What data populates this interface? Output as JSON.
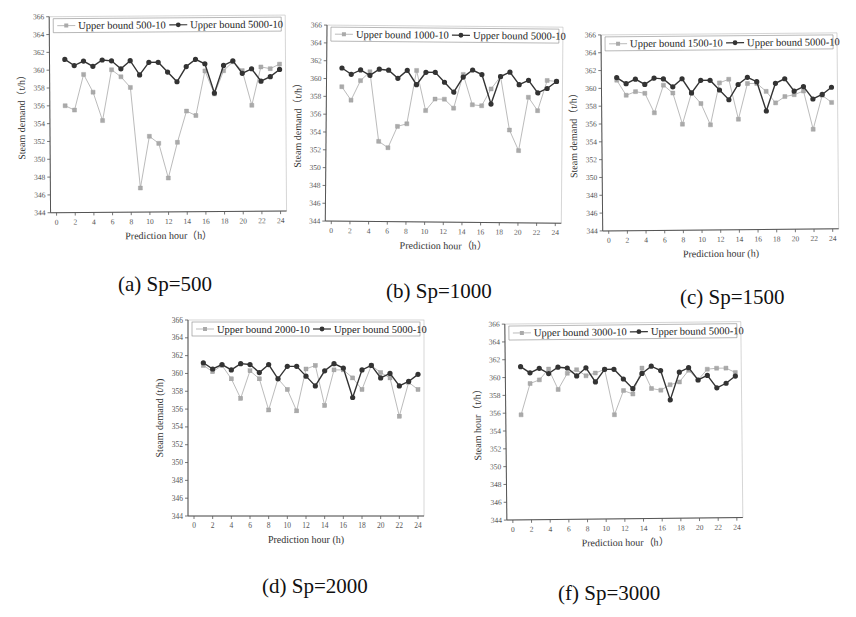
{
  "figure": {
    "captions": [
      "(a) Sp=500",
      "(b) Sp=1000",
      "(c) Sp=1500",
      "(d) Sp=2000",
      "(f) Sp=3000"
    ]
  },
  "colors": {
    "baseline_series": "#333333",
    "compare_series": "#aaaaaa",
    "axis": "#555555"
  },
  "chart_data": [
    {
      "id": "a",
      "type": "line",
      "caption": "(a) Sp=500",
      "xlabel": "Prediction hour（h）",
      "ylabel": "Steam demand（t/h）",
      "xlim": [
        0,
        24
      ],
      "ylim": [
        344,
        366
      ],
      "xticks": [
        0,
        2,
        4,
        6,
        8,
        10,
        12,
        14,
        16,
        18,
        20,
        22,
        24
      ],
      "yticks": [
        344,
        346,
        348,
        350,
        352,
        354,
        356,
        358,
        360,
        362,
        364,
        366
      ],
      "legend_position": "top",
      "x": [
        1,
        2,
        3,
        4,
        5,
        6,
        7,
        8,
        9,
        10,
        11,
        12,
        13,
        14,
        15,
        16,
        17,
        18,
        19,
        20,
        21,
        22,
        23,
        24
      ],
      "series": [
        {
          "name": "Upper bound 500-10",
          "marker": "square",
          "values": [
            356.0,
            355.5,
            359.5,
            357.5,
            354.3,
            360.0,
            359.2,
            358.0,
            346.7,
            352.5,
            351.7,
            347.8,
            351.8,
            355.3,
            354.8,
            359.8,
            357.2,
            359.8,
            360.8,
            359.8,
            355.9,
            360.2,
            360.0,
            360.5
          ]
        },
        {
          "name": "Upper bound 5000-10",
          "marker": "circle",
          "values": [
            361.2,
            360.5,
            361.0,
            360.4,
            361.1,
            361.0,
            360.1,
            361.0,
            359.4,
            360.8,
            360.8,
            359.7,
            358.6,
            360.3,
            361.1,
            360.6,
            357.3,
            360.4,
            360.9,
            359.5,
            360.0,
            358.6,
            359.1,
            359.9
          ]
        }
      ]
    },
    {
      "id": "b",
      "type": "line",
      "caption": "(b) Sp=1000",
      "xlabel": "Prediction hour（h）",
      "ylabel": "Steam demand（t/h）",
      "xlim": [
        0,
        24
      ],
      "ylim": [
        344,
        366
      ],
      "xticks": [
        0,
        2,
        4,
        6,
        8,
        10,
        12,
        14,
        16,
        18,
        20,
        22,
        24
      ],
      "yticks": [
        344,
        346,
        348,
        350,
        352,
        354,
        356,
        358,
        360,
        362,
        364,
        366
      ],
      "legend_position": "top",
      "x": [
        1,
        2,
        3,
        4,
        5,
        6,
        7,
        8,
        9,
        10,
        11,
        12,
        13,
        14,
        15,
        16,
        17,
        18,
        19,
        20,
        21,
        22,
        23,
        24
      ],
      "series": [
        {
          "name": "Upper bound 1000-10",
          "marker": "square",
          "values": [
            359.1,
            357.6,
            359.8,
            360.8,
            353.0,
            352.3,
            354.7,
            355.0,
            361.0,
            356.5,
            357.8,
            357.8,
            356.8,
            360.6,
            357.2,
            357.1,
            359.0,
            360.4,
            354.4,
            352.1,
            358.1,
            356.6,
            360.0,
            359.9
          ]
        },
        {
          "name": "Upper bound 5000-10",
          "marker": "circle",
          "values": [
            361.2,
            360.5,
            361.0,
            360.4,
            361.1,
            361.0,
            360.1,
            361.0,
            359.4,
            360.8,
            360.8,
            359.7,
            358.6,
            360.3,
            361.1,
            360.6,
            357.3,
            360.4,
            360.9,
            359.5,
            360.0,
            358.6,
            359.1,
            359.9
          ]
        }
      ]
    },
    {
      "id": "c",
      "type": "line",
      "caption": "(c) Sp=1500",
      "xlabel": "Prediction hour (h)",
      "ylabel": "Steam demand（t/h）",
      "xlim": [
        0,
        24
      ],
      "ylim": [
        344,
        366
      ],
      "xticks": [
        0,
        2,
        4,
        6,
        8,
        10,
        12,
        14,
        16,
        18,
        20,
        22,
        24
      ],
      "yticks": [
        344,
        346,
        348,
        350,
        352,
        354,
        356,
        358,
        360,
        362,
        364,
        366
      ],
      "legend_position": "top",
      "x": [
        1,
        2,
        3,
        4,
        5,
        6,
        7,
        8,
        9,
        10,
        11,
        12,
        13,
        14,
        15,
        16,
        17,
        18,
        19,
        20,
        21,
        22,
        23,
        24
      ],
      "series": [
        {
          "name": "Upper bound 1500-10",
          "marker": "square",
          "values": [
            360.9,
            359.2,
            359.6,
            359.4,
            357.2,
            360.3,
            359.4,
            355.9,
            359.4,
            358.2,
            355.8,
            360.5,
            360.9,
            356.4,
            360.4,
            360.4,
            359.5,
            358.2,
            358.9,
            359.1,
            359.5,
            355.2,
            359.0,
            358.2
          ]
        },
        {
          "name": "Upper bound 5000-10",
          "marker": "circle",
          "values": [
            361.2,
            360.5,
            361.0,
            360.4,
            361.1,
            361.0,
            360.1,
            361.0,
            359.4,
            360.8,
            360.8,
            359.7,
            358.6,
            360.3,
            361.1,
            360.6,
            357.3,
            360.4,
            360.9,
            359.5,
            360.0,
            358.6,
            359.1,
            359.9
          ]
        }
      ]
    },
    {
      "id": "d",
      "type": "line",
      "caption": "(d) Sp=2000",
      "xlabel": "Prediction hour (h)",
      "ylabel": "Steam demand (t/h)",
      "xlim": [
        0,
        24
      ],
      "ylim": [
        344,
        366
      ],
      "xticks": [
        0,
        2,
        4,
        6,
        8,
        10,
        12,
        14,
        16,
        18,
        20,
        22,
        24
      ],
      "yticks": [
        344,
        346,
        348,
        350,
        352,
        354,
        356,
        358,
        360,
        362,
        364,
        366
      ],
      "legend_position": "top",
      "x": [
        1,
        2,
        3,
        4,
        5,
        6,
        7,
        8,
        9,
        10,
        11,
        12,
        13,
        14,
        15,
        16,
        17,
        18,
        19,
        20,
        21,
        22,
        23,
        24
      ],
      "series": [
        {
          "name": "Upper bound 2000-10",
          "marker": "square",
          "values": [
            360.9,
            360.2,
            360.9,
            359.4,
            357.2,
            360.3,
            359.4,
            355.9,
            359.4,
            358.2,
            355.8,
            360.5,
            360.9,
            356.4,
            360.4,
            360.4,
            359.5,
            358.2,
            360.9,
            360.1,
            359.5,
            355.2,
            359.0,
            358.2
          ]
        },
        {
          "name": "Upper bound 5000-10",
          "marker": "circle",
          "values": [
            361.2,
            360.5,
            361.0,
            360.4,
            361.1,
            361.0,
            360.1,
            361.0,
            359.4,
            360.8,
            360.8,
            359.7,
            358.6,
            360.3,
            361.1,
            360.6,
            357.3,
            360.4,
            360.9,
            359.5,
            360.0,
            358.6,
            359.1,
            359.9
          ]
        }
      ]
    },
    {
      "id": "f",
      "type": "line",
      "caption": "(f) Sp=3000",
      "xlabel": "Prediction hour（h）",
      "ylabel": "Steam hour（t/h）",
      "xlim": [
        0,
        24
      ],
      "ylim": [
        344,
        366
      ],
      "xticks": [
        0,
        2,
        4,
        6,
        8,
        10,
        12,
        14,
        16,
        18,
        20,
        22,
        24
      ],
      "yticks": [
        344,
        346,
        348,
        350,
        352,
        354,
        356,
        358,
        360,
        362,
        364,
        366
      ],
      "legend_position": "top",
      "x": [
        1,
        2,
        3,
        4,
        5,
        6,
        7,
        8,
        9,
        10,
        11,
        12,
        13,
        14,
        15,
        16,
        17,
        18,
        19,
        20,
        21,
        22,
        23,
        24
      ],
      "series": [
        {
          "name": "Upper bound 3000-10",
          "marker": "square",
          "values": [
            355.8,
            359.3,
            359.7,
            360.9,
            358.6,
            360.4,
            360.8,
            360.1,
            360.4,
            360.8,
            355.7,
            358.4,
            358.0,
            360.9,
            358.6,
            358.4,
            359.0,
            359.3,
            360.6,
            359.5,
            360.7,
            360.8,
            360.8,
            360.3
          ]
        },
        {
          "name": "Upper bound 5000-10",
          "marker": "circle",
          "values": [
            361.2,
            360.5,
            361.0,
            360.4,
            361.1,
            361.0,
            360.1,
            361.0,
            359.4,
            360.8,
            360.8,
            359.7,
            358.6,
            360.3,
            361.1,
            360.6,
            357.3,
            360.4,
            360.9,
            359.5,
            360.0,
            358.6,
            359.1,
            359.9
          ]
        }
      ]
    }
  ],
  "layout": {
    "panels": [
      {
        "left": 14,
        "top": 6,
        "rotate": -0.4
      },
      {
        "left": 290,
        "top": 16,
        "rotate": 0.5
      },
      {
        "left": 566,
        "top": 24,
        "rotate": -0.5
      },
      {
        "left": 152,
        "top": 310,
        "rotate": 0
      },
      {
        "left": 470,
        "top": 313,
        "rotate": -0.6
      }
    ],
    "caption_pos": [
      {
        "left": 118,
        "top": 272
      },
      {
        "left": 386,
        "top": 279
      },
      {
        "left": 680,
        "top": 285
      },
      {
        "left": 262,
        "top": 574
      },
      {
        "left": 558,
        "top": 581
      }
    ]
  }
}
